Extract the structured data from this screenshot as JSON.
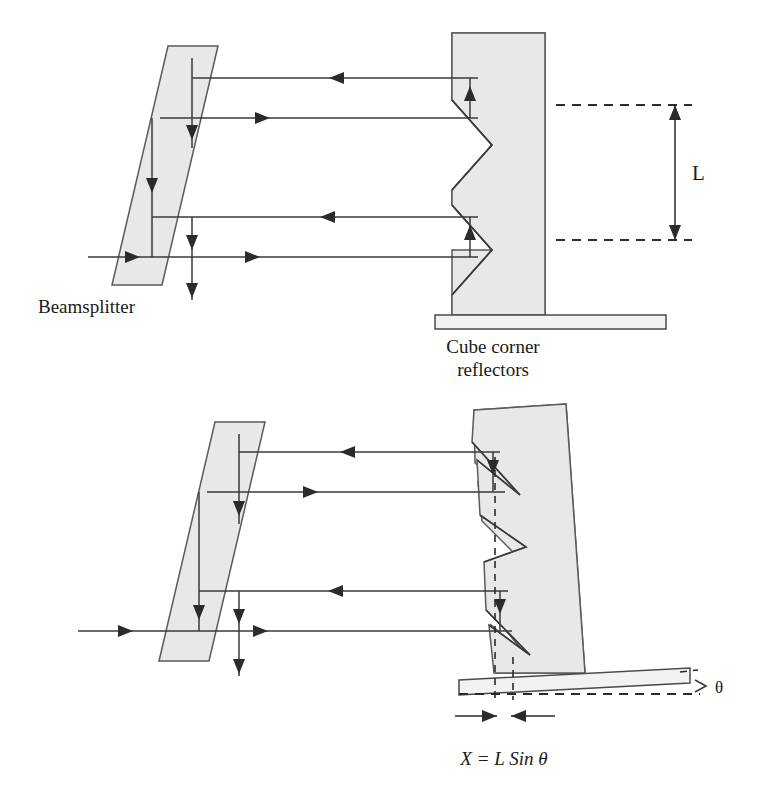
{
  "figure": {
    "labels": {
      "beamsplitter": "Beamsplitter",
      "cube_corner_line1": "Cube corner",
      "cube_corner_line2": "reflectors",
      "dimension_L": "L",
      "theta": "θ",
      "equation": "X = L Sin θ"
    },
    "colors": {
      "glass_fill": "#e8e8e8",
      "glass_stroke": "#5a5a5a",
      "ray_stroke": "#3a3a3a",
      "text": "#1a1a1a",
      "background": "#ffffff",
      "base_plate_fill": "#f2f2f2"
    },
    "panels": [
      {
        "name": "upper-panel",
        "description": "Aligned configuration: cube corner reflector block vertical, beams retro-reflect along same path",
        "beamsplitter": {
          "shape": "parallelogram",
          "points": "168,46 218,46 162,285 112,285"
        },
        "reflector_block": {
          "x": 452,
          "y": 33,
          "width": 93,
          "height": 282,
          "notch_count": 2
        },
        "base_plate": {
          "x": 435,
          "y": 315,
          "width": 231,
          "height": 13
        },
        "rays": [
          {
            "id": "ray-1-return",
            "y": 78,
            "direction": "left"
          },
          {
            "id": "ray-2-incident",
            "y": 118,
            "direction": "right"
          },
          {
            "id": "ray-3-return",
            "y": 217,
            "direction": "left"
          },
          {
            "id": "ray-4-incident",
            "y": 257,
            "direction": "right"
          }
        ],
        "dimension": {
          "label": "L",
          "from_y": 105,
          "to_y": 240,
          "x": 675
        }
      },
      {
        "name": "lower-panel",
        "description": "Tilted configuration: reflector block rotated by angle theta, producing lateral offset X",
        "beamsplitter": {
          "shape": "parallelogram",
          "points": "215,422 265,422 209,661 159,661"
        },
        "reflector_block": {
          "description": "tilted rectangle rotated about base",
          "points": "474,410 566,404 585,673 493,673"
        },
        "base_plate": {
          "description": "tilted base plate",
          "points": "459,681 690,670 690,684 459,695"
        },
        "rays": [
          {
            "id": "ray-1-return",
            "y": 452,
            "direction": "left"
          },
          {
            "id": "ray-2-incident",
            "y": 492,
            "direction": "right"
          },
          {
            "id": "ray-3-return",
            "y": 591,
            "direction": "left"
          },
          {
            "id": "ray-4-incident",
            "y": 631,
            "direction": "right"
          }
        ],
        "offset_marker": {
          "label": "X = L Sin θ",
          "dashed_x_left": 495,
          "dashed_x_right": 513
        },
        "angle_marker": {
          "label": "θ",
          "x": 712,
          "y": 688
        }
      }
    ]
  }
}
